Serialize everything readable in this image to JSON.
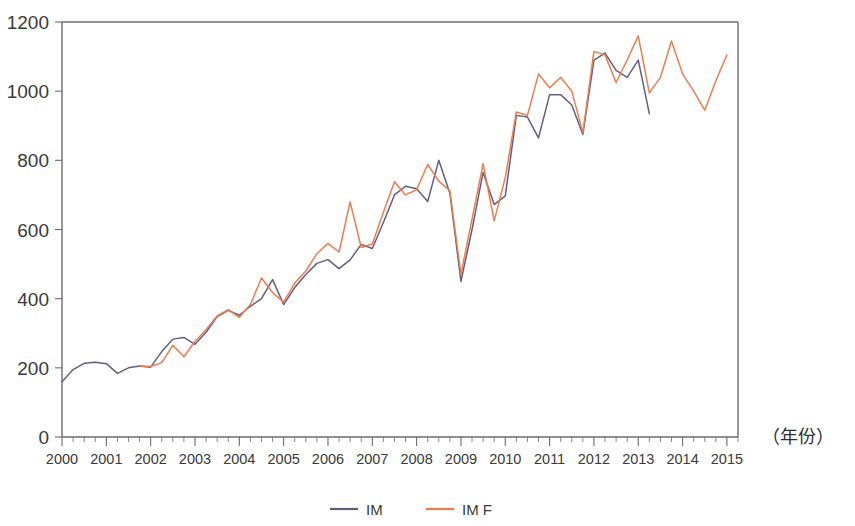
{
  "chart_data": {
    "type": "line",
    "title": "",
    "subtitle": "",
    "xlabel": "（年份）",
    "ylabel": "",
    "ylim": [
      0,
      1200
    ],
    "xlim": [
      2000.0,
      2015.25
    ],
    "yticks": [
      0,
      200,
      400,
      600,
      800,
      1000,
      1200
    ],
    "xticks": [
      2000,
      2001,
      2002,
      2003,
      2004,
      2005,
      2006,
      2007,
      2008,
      2009,
      2010,
      2011,
      2012,
      2013,
      2014,
      2015
    ],
    "xtick_labels": [
      "2000",
      "2001",
      "2002",
      "2003",
      "2004",
      "2005",
      "2006",
      "2007",
      "2008",
      "2009",
      "2010",
      "2011",
      "2012",
      "2013",
      "2014",
      "2015"
    ],
    "minor_ticks_per_interval": 4,
    "grid": false,
    "legend_position": "bottom",
    "x": [
      2000.0,
      2000.25,
      2000.5,
      2000.75,
      2001.0,
      2001.25,
      2001.5,
      2001.75,
      2002.0,
      2002.25,
      2002.5,
      2002.75,
      2003.0,
      2003.25,
      2003.5,
      2003.75,
      2004.0,
      2004.25,
      2004.5,
      2004.75,
      2005.0,
      2005.25,
      2005.5,
      2005.75,
      2006.0,
      2006.25,
      2006.5,
      2006.75,
      2007.0,
      2007.25,
      2007.5,
      2007.75,
      2008.0,
      2008.25,
      2008.5,
      2008.75,
      2009.0,
      2009.25,
      2009.5,
      2009.75,
      2010.0,
      2010.25,
      2010.5,
      2010.75,
      2011.0,
      2011.25,
      2011.5,
      2011.75,
      2012.0,
      2012.25,
      2012.5,
      2012.75,
      2013.0,
      2013.25,
      2013.5,
      2013.75,
      2014.0,
      2014.25,
      2014.5,
      2014.75,
      2015.0
    ],
    "series": [
      {
        "name": "IM",
        "color": "#5f6080",
        "values": [
          160,
          195,
          213,
          216,
          212,
          184,
          200,
          205,
          202,
          247,
          283,
          288,
          268,
          303,
          348,
          366,
          352,
          378,
          400,
          455,
          383,
          432,
          470,
          502,
          513,
          487,
          512,
          557,
          545,
          620,
          700,
          725,
          718,
          681,
          800,
          705,
          450,
          600,
          765,
          672,
          697,
          930,
          925,
          865,
          990,
          990,
          960,
          875,
          1090,
          1110,
          1060,
          1040,
          1090,
          935,
          null,
          null,
          null,
          null,
          null,
          null,
          null
        ]
      },
      {
        "name": "IM F",
        "color": "#ef7b4e",
        "values": [
          null,
          null,
          null,
          null,
          null,
          null,
          null,
          205,
          204,
          215,
          265,
          232,
          277,
          310,
          350,
          368,
          346,
          383,
          460,
          418,
          390,
          445,
          480,
          530,
          560,
          535,
          680,
          548,
          558,
          650,
          738,
          700,
          715,
          788,
          740,
          712,
          470,
          630,
          790,
          625,
          750,
          940,
          930,
          1050,
          1010,
          1040,
          1000,
          880,
          1115,
          1105,
          1025,
          1090,
          1160,
          995,
          1040,
          1145,
          1050,
          1000,
          945,
          1030,
          1105
        ]
      }
    ]
  },
  "legend": {
    "items": [
      {
        "label": "IM",
        "color": "#5f6080"
      },
      {
        "label": "IM  F",
        "color": "#ef7b4e"
      }
    ]
  }
}
